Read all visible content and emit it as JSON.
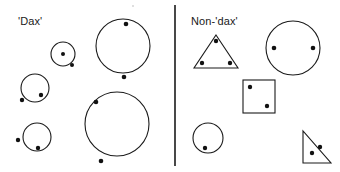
{
  "figure": {
    "width": 340,
    "height": 172,
    "background": "#ffffff",
    "stroke_color": "#1a1a1a",
    "dot_color": "#111111",
    "stroke_width": 1.1
  },
  "columns": [
    {
      "id": "dax",
      "label": "'Dax'"
    },
    {
      "id": "nondax",
      "label": "Non-'dax'"
    }
  ],
  "divider": {
    "name": "column-divider",
    "x1": 175,
    "y1": 5,
    "x2": 175,
    "y2": 166,
    "stroke": "#1a1a1a",
    "stroke_width": 1.6
  },
  "artifact_dot": {
    "cx": 133,
    "cy": 6,
    "r": 1.1,
    "fill": "#d8d8d8"
  },
  "chart_data": {
    "type": "scatter",
    "xlabel": "",
    "ylabel": "",
    "xlim": [
      0,
      340
    ],
    "ylim": [
      0,
      172
    ],
    "grid": false,
    "legend_position": "none",
    "annotations": [
      "'Dax'",
      "Non-'dax'"
    ],
    "groups": [
      {
        "name": "'Dax'",
        "label": "'Dax'",
        "shapes": [
          {
            "name": "dax-small-circle",
            "kind": "circle",
            "cx": 63,
            "cy": 54,
            "r": 12,
            "dots": [
              {
                "cx": 63,
                "cy": 54,
                "r": 2.0,
                "inside": true
              },
              {
                "cx": 72,
                "cy": 65,
                "r": 2.0,
                "inside": false
              }
            ]
          },
          {
            "name": "dax-medium-circle",
            "kind": "circle",
            "cx": 35,
            "cy": 88,
            "r": 14,
            "dots": [
              {
                "cx": 41,
                "cy": 95,
                "r": 2.2,
                "inside": true
              },
              {
                "cx": 22,
                "cy": 100,
                "r": 2.2,
                "inside": false
              }
            ]
          },
          {
            "name": "dax-bottom-circle",
            "kind": "circle",
            "cx": 37,
            "cy": 137,
            "r": 14,
            "dots": [
              {
                "cx": 38,
                "cy": 148,
                "r": 2.2,
                "inside": true
              },
              {
                "cx": 18,
                "cy": 140,
                "r": 2.2,
                "inside": false
              }
            ]
          },
          {
            "name": "dax-large-circle-top",
            "kind": "circle",
            "cx": 123,
            "cy": 46,
            "r": 27,
            "dots": [
              {
                "cx": 126,
                "cy": 24,
                "r": 2.3,
                "inside": true
              },
              {
                "cx": 124,
                "cy": 77,
                "r": 2.3,
                "inside": false
              }
            ]
          },
          {
            "name": "dax-large-circle-bottom",
            "kind": "circle",
            "cx": 117,
            "cy": 124,
            "r": 32,
            "dots": [
              {
                "cx": 96,
                "cy": 102,
                "r": 2.3,
                "inside": true
              },
              {
                "cx": 101,
                "cy": 161,
                "r": 2.3,
                "inside": false
              }
            ]
          }
        ]
      },
      {
        "name": "Non-'dax'",
        "label": "Non-'dax'",
        "shapes": [
          {
            "name": "nondax-triangle",
            "kind": "triangle",
            "points": "216,35 238,68 194,68",
            "dots": [
              {
                "cx": 216,
                "cy": 41,
                "r": 2.2,
                "inside": true
              },
              {
                "cx": 202,
                "cy": 63,
                "r": 2.2,
                "inside": true
              },
              {
                "cx": 230,
                "cy": 63,
                "r": 2.2,
                "inside": true
              }
            ]
          },
          {
            "name": "nondax-large-circle",
            "kind": "circle",
            "cx": 293,
            "cy": 48,
            "r": 27,
            "dots": [
              {
                "cx": 274,
                "cy": 48,
                "r": 2.3,
                "inside": true
              },
              {
                "cx": 313,
                "cy": 48,
                "r": 2.3,
                "inside": true
              }
            ]
          },
          {
            "name": "nondax-square",
            "kind": "rect",
            "x": 243,
            "y": 80,
            "w": 32,
            "h": 33,
            "dots": [
              {
                "cx": 250,
                "cy": 87,
                "r": 2.2,
                "inside": true
              },
              {
                "cx": 267,
                "cy": 106,
                "r": 2.2,
                "inside": true
              }
            ]
          },
          {
            "name": "nondax-circle",
            "kind": "circle",
            "cx": 208,
            "cy": 138,
            "r": 15,
            "dots": [
              {
                "cx": 205,
                "cy": 148,
                "r": 2.2,
                "inside": true
              }
            ]
          },
          {
            "name": "nondax-right-triangle",
            "kind": "triangle",
            "points": "303,131 303,163 331,163",
            "dots": [
              {
                "cx": 312,
                "cy": 153,
                "r": 2.2,
                "inside": true
              },
              {
                "cx": 320,
                "cy": 147,
                "r": 2.2,
                "inside": true
              }
            ]
          }
        ]
      }
    ]
  }
}
